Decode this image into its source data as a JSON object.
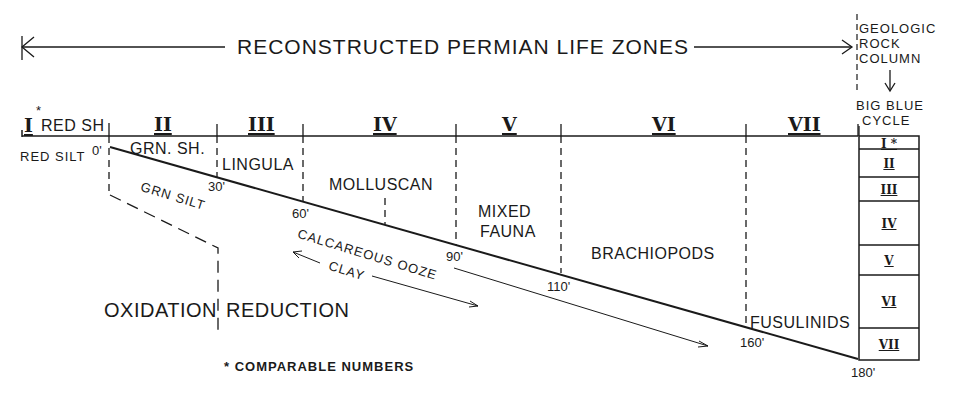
{
  "title": "RECONSTRUCTED PERMIAN LIFE ZONES",
  "side_header": {
    "line1": "GEOLOGIC",
    "line2": "ROCK",
    "line3": "COLUMN",
    "line4": "BIG BLUE",
    "line5": "CYCLE"
  },
  "zones": [
    {
      "numeral": "I",
      "marker": "*",
      "top_label": "RED SH",
      "fauna": ""
    },
    {
      "numeral": "II",
      "top_label": "",
      "fauna": "GRN. SH."
    },
    {
      "numeral": "III",
      "top_label": "",
      "fauna": "LINGULA"
    },
    {
      "numeral": "IV",
      "top_label": "",
      "fauna": "MOLLUSCAN"
    },
    {
      "numeral": "V",
      "top_label": "",
      "fauna_line1": "MIXED",
      "fauna_line2": "FAUNA"
    },
    {
      "numeral": "VI",
      "top_label": "",
      "fauna": "BRACHIOPODS"
    },
    {
      "numeral": "VII",
      "top_label": "",
      "fauna": "FUSULINIDS"
    }
  ],
  "depths": [
    "0'",
    "30'",
    "60'",
    "90'",
    "110'",
    "160'",
    "180'"
  ],
  "sediments": {
    "red_silt": "RED SILT",
    "grn_silt": "GRN SILT",
    "calcareous_ooze": "CALCAREOUS OOZE",
    "clay": "CLAY"
  },
  "environments": {
    "oxidation": "OXIDATION",
    "reduction": "REDUCTION"
  },
  "rock_column": [
    "I *",
    "II",
    "III",
    "IV",
    "V",
    "VI",
    "VII"
  ],
  "legend": "* COMPARABLE NUMBERS"
}
